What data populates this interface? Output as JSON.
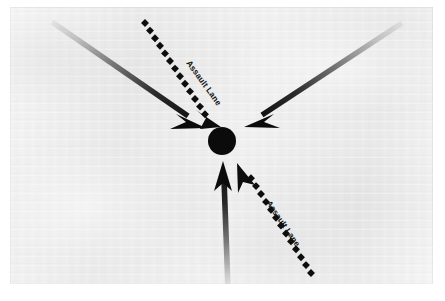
{
  "page": {
    "background_color": "#ffffff",
    "width": 445,
    "height": 301
  },
  "photo": {
    "name": "scanned-photo-plate",
    "x": 10,
    "y": 7,
    "width": 423,
    "height": 277,
    "background_color": "#e8e8e8",
    "border_color": "#c3c3c3"
  },
  "caption": {
    "text": "",
    "color": "#afafaf",
    "note": "faint illegible line of scanned body text beneath the figure"
  },
  "diagram": {
    "ink_color": "#111111",
    "objective": {
      "name": "objective-marker",
      "shape": "filled-circle",
      "cx": 212,
      "cy": 134,
      "r": 14,
      "color": "#0d0d0d"
    },
    "solid_arrows": [
      {
        "name": "assault-arrow-upper-left",
        "label": "Upper-left axis of advance",
        "tail": {
          "x": 42,
          "y": 15
        },
        "head": {
          "x": 190,
          "y": 117
        },
        "tail_opacity": 0.1,
        "head_opacity": 1.0,
        "width": 5.5
      },
      {
        "name": "assault-arrow-upper-right",
        "label": "Upper-right axis of advance",
        "tail": {
          "x": 392,
          "y": 16
        },
        "head": {
          "x": 240,
          "y": 116
        },
        "tail_opacity": 0.1,
        "head_opacity": 1.0,
        "width": 5.5
      },
      {
        "name": "assault-arrow-bottom",
        "label": "Southern axis of advance",
        "tail": {
          "x": 218,
          "y": 281
        },
        "head": {
          "x": 213,
          "y": 156
        },
        "tail_opacity": 0.1,
        "head_opacity": 1.0,
        "width": 5.5
      }
    ],
    "dotted_lanes": [
      {
        "name": "assault-lane-upper",
        "label": "Assault Lane",
        "tail": {
          "x": 135,
          "y": 16
        },
        "head": {
          "x": 207,
          "y": 116
        },
        "dot_shape": "square",
        "dot_size": 5.6,
        "dot_count": 13,
        "label_rotation_deg": 54
      },
      {
        "name": "assault-lane-lower",
        "label": "Assault Lane",
        "tail": {
          "x": 301,
          "y": 266
        },
        "head": {
          "x": 229,
          "y": 159
        },
        "dot_shape": "square",
        "dot_size": 5.6,
        "dot_count": 13,
        "label_rotation_deg": 56
      }
    ]
  }
}
